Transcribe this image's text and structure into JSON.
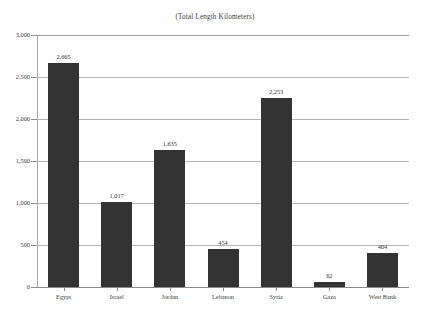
{
  "chart_data": {
    "type": "bar",
    "title": "(Total Length Kilometers)",
    "xlabel": "",
    "ylabel": "",
    "categories": [
      "Egypt",
      "Israel",
      "Jordan",
      "Lebanon",
      "Syria",
      "Gaza",
      "West Bank"
    ],
    "values": [
      2665,
      1017,
      1635,
      454,
      2253,
      62,
      404
    ],
    "value_labels": [
      "2,665",
      "1,017",
      "1,635",
      "454",
      "2,253",
      "62",
      "404"
    ],
    "ylim": [
      0,
      3000
    ],
    "y_ticks": [
      0,
      500,
      1000,
      1500,
      2000,
      2500,
      3000
    ],
    "y_tick_labels": [
      "0",
      "500",
      "1,000",
      "1,500",
      "2,000",
      "2,500",
      "3,000"
    ],
    "grid": true,
    "legend": false,
    "legend_position": "none",
    "bar_color": "#333333",
    "gridline_color": "#b4b4b4",
    "axis_color": "#8a8a8a",
    "text_color": "#3d3d3d",
    "background_color": "#ffffff"
  }
}
